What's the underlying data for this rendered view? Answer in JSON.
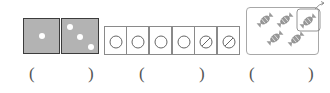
{
  "worksheet": {
    "panels": [
      {
        "id": "dice-squares",
        "description": "Two gray squares with white dots",
        "squares": [
          {
            "dots": 1
          },
          {
            "dots": 3
          }
        ],
        "fill_color": "#b3b3b3"
      },
      {
        "id": "circle-cells",
        "description": "Six cells each containing a circle; last two crossed out",
        "cells": [
          {
            "crossed": false
          },
          {
            "crossed": false
          },
          {
            "crossed": false
          },
          {
            "crossed": false
          },
          {
            "crossed": true
          },
          {
            "crossed": true
          }
        ]
      },
      {
        "id": "candies",
        "description": "Five candies in a box, one circled and moved out with an arrow",
        "candy_count": 5,
        "circled_count": 1,
        "arrow": "up-right"
      }
    ],
    "answer_blanks": [
      {
        "open": "(",
        "close": ")"
      },
      {
        "open": "(",
        "close": ")"
      },
      {
        "open": "(",
        "close": ")"
      }
    ]
  }
}
